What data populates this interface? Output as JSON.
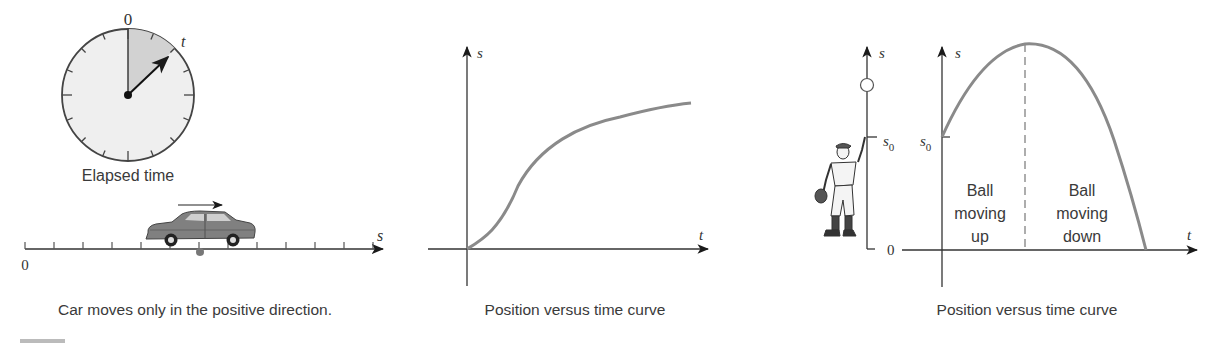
{
  "panels": {
    "left": {
      "clock": {
        "top_label": "0",
        "hand_label": "t",
        "caption": "Elapsed time"
      },
      "number_line": {
        "origin_label": "0",
        "axis_label": "s",
        "tick_count": 13
      },
      "caption": "Car moves only in the positive direction."
    },
    "middle": {
      "y_axis_label": "s",
      "x_axis_label": "t",
      "caption": "Position versus time curve"
    },
    "right": {
      "ball_axis_label": "s",
      "ball_axis_s0_label": "s",
      "ball_axis_s0_sub": "0",
      "ball_axis_zero_label": "0",
      "y_axis_label": "s",
      "x_axis_label": "t",
      "s0_label": "s",
      "s0_sub": "0",
      "region_up": [
        "Ball",
        "moving",
        "up"
      ],
      "region_down": [
        "Ball",
        "moving",
        "down"
      ],
      "caption": "Position versus time curve"
    }
  },
  "colors": {
    "curve": "#8a8a8a",
    "axis": "#333333",
    "clock_face": "#eeeeee",
    "clock_sector": "#d4d4d4",
    "car_body": "#7f7f7f"
  },
  "chart_data": [
    {
      "type": "line",
      "title": "Position versus time curve",
      "xlabel": "t",
      "ylabel": "s",
      "grid": false,
      "description": "Monotonically increasing s(t), starting at origin, concave up briefly then concave down approaching a plateau",
      "x": [
        0,
        0.1,
        0.2,
        0.3,
        0.4,
        0.5,
        0.6,
        0.7,
        0.8,
        0.9,
        1.0
      ],
      "values": [
        0,
        0.12,
        0.3,
        0.46,
        0.58,
        0.68,
        0.76,
        0.82,
        0.87,
        0.9,
        0.92
      ]
    },
    {
      "type": "line",
      "title": "Position versus time curve",
      "xlabel": "t",
      "ylabel": "s",
      "grid": false,
      "description": "Parabolic trajectory of a ball thrown upward from height s0; dashed line at peak separates 'Ball moving up' and 'Ball moving down'",
      "annotations": [
        "s0",
        "Ball moving up",
        "Ball moving down"
      ],
      "x": [
        0,
        0.1,
        0.2,
        0.3,
        0.4,
        0.405,
        0.5,
        0.6,
        0.7,
        0.8,
        0.9,
        0.99
      ],
      "values": [
        0.5,
        0.72,
        0.88,
        0.98,
        1.0,
        1.0,
        0.98,
        0.9,
        0.76,
        0.56,
        0.3,
        0.0
      ]
    }
  ]
}
